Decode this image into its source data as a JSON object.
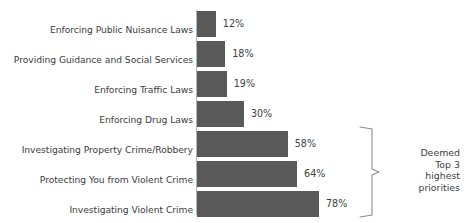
{
  "chart_data": {
    "type": "bar",
    "orientation": "horizontal",
    "title": "",
    "subtitle": "",
    "xlabel": "",
    "ylabel": "",
    "xlim": [
      0,
      100
    ],
    "grid": false,
    "legend": null,
    "value_suffix": "%",
    "categories": [
      "Enforcing Public Nuisance Laws",
      "Providing Guidance and Social Services",
      "Enforcing Traffic Laws",
      "Enforcing Drug Laws",
      "Investigating Property Crime/Robbery",
      "Protecting You from Violent Crime",
      "Investigating Violent Crime"
    ],
    "values": [
      12,
      18,
      19,
      30,
      58,
      64,
      78
    ],
    "value_labels": [
      "12%",
      "18%",
      "19%",
      "30%",
      "58%",
      "64%",
      "78%"
    ],
    "bar_color": "#595959",
    "text_color": "#3d3d3d",
    "annotations": [
      {
        "name": "top-3-brace",
        "lines": [
          "Deemed",
          "Top 3",
          "highest",
          "priorities"
        ],
        "covers_categories": [
          "Investigating Property Crime/Robbery",
          "Protecting You from Violent Crime",
          "Investigating Violent Crime"
        ]
      }
    ]
  }
}
